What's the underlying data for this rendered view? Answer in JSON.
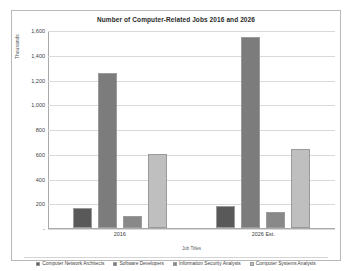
{
  "chart_data": {
    "type": "bar",
    "title": "Number of Computer-Related Jobs 2016 and 2026",
    "xlabel": "Job Titles",
    "ylabel": "Thousands",
    "categories": [
      "2016",
      "2026 Est."
    ],
    "ylim": [
      0,
      1600
    ],
    "ytick_labels": [
      "1,600",
      "1,400",
      "1,200",
      "1,000",
      "800",
      "600",
      "400",
      "200",
      "-"
    ],
    "ytick_values": [
      1600,
      1400,
      1200,
      1000,
      800,
      600,
      400,
      200,
      0
    ],
    "grid": true,
    "legend_position": "bottom",
    "series": [
      {
        "name": "Computer Network Architects",
        "color": "#595959",
        "values": [
          163,
          175
        ]
      },
      {
        "name": "Software Developers",
        "color": "#7c7c7c",
        "values": [
          1256,
          1545
        ]
      },
      {
        "name": "Information Security Analysts",
        "color": "#898989",
        "values": [
          100,
          128
        ]
      },
      {
        "name": "Computer Systems Analysts",
        "color": "#bfbfbf",
        "values": [
          600,
          640
        ]
      }
    ]
  }
}
